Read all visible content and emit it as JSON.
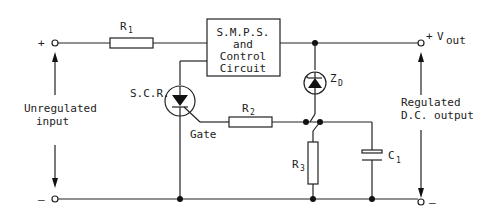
{
  "diagram": {
    "title": "",
    "colors": {
      "line": "#222222",
      "background": "#ffffff"
    },
    "terminals": {
      "input_plus": "+",
      "input_minus": "–",
      "output_plus": "+",
      "output_minus": "–"
    },
    "labels": {
      "vout_main": "V",
      "vout_sub": "out",
      "unregulated_line1": "Unregulated",
      "unregulated_line2": "input",
      "regulated_line1": "Regulated",
      "regulated_line2": "D.C. output",
      "gate": "Gate",
      "scr": "S.C.R."
    },
    "block": {
      "line1": "S.M.P.S.",
      "line2": "and",
      "line3": "Control",
      "line4": "Circuit"
    },
    "components": {
      "r1": {
        "main": "R",
        "sub": "1"
      },
      "r2": {
        "main": "R",
        "sub": "2"
      },
      "r3": {
        "main": "R",
        "sub": "3"
      },
      "c1": {
        "main": "C",
        "sub": "1"
      },
      "zd": {
        "main": "Z",
        "sub": "D"
      }
    }
  }
}
